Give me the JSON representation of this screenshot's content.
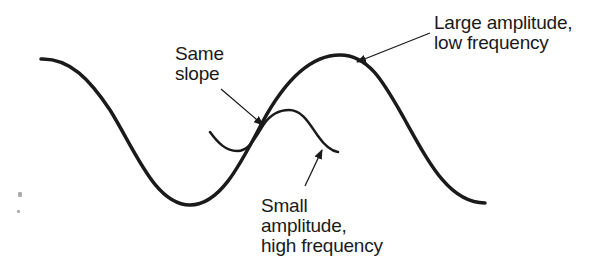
{
  "diagram": {
    "labels": {
      "same_slope": [
        "Same",
        "slope"
      ],
      "large_wave": [
        "Large amplitude,",
        "low frequency"
      ],
      "small_wave": [
        "Small",
        "amplitude,",
        "high frequency"
      ]
    },
    "curves": {
      "large_wave": {
        "description": "Large amplitude, low frequency wave",
        "stroke": "#1a1a1a",
        "stroke_width": 3.5,
        "points": {
          "start": [
            41,
            59
          ],
          "trough": [
            190,
            205
          ],
          "peak": [
            340,
            55
          ],
          "end": [
            485,
            203
          ]
        }
      },
      "small_wave": {
        "description": "Small amplitude, high frequency wave",
        "stroke": "#1a1a1a",
        "stroke_width": 2.5,
        "points": {
          "start": [
            210,
            132
          ],
          "trough": [
            235,
            151
          ],
          "tangent": [
            262,
            123
          ],
          "peak": [
            290,
            110
          ],
          "end": [
            338,
            152
          ]
        }
      }
    },
    "arrows": {
      "same_slope": {
        "from": [
          221,
          89
        ],
        "to": [
          263,
          125
        ]
      },
      "large_wave": {
        "from": [
          430,
          33
        ],
        "to": [
          357,
          62
        ]
      },
      "small_wave": {
        "from": [
          305,
          186
        ],
        "to": [
          322,
          150
        ]
      }
    },
    "colors": {
      "ink": "#1a1a1a",
      "background": "#ffffff"
    }
  }
}
